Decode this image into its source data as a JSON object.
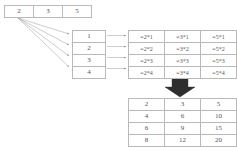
{
  "diagram": {
    "source_row": {
      "name": "source-values",
      "values": [
        "2",
        "3",
        "5"
      ]
    },
    "multiplier_column": {
      "name": "multiplier-values",
      "values": [
        "1",
        "2",
        "3",
        "4"
      ]
    },
    "formula_grid": {
      "name": "formula-table",
      "rows": [
        [
          "=2*1",
          "=3*1",
          "=5*1"
        ],
        [
          "=2*2",
          "=3*2",
          "=5*2"
        ],
        [
          "=2*3",
          "=3*3",
          "=5*3"
        ],
        [
          "=2*4",
          "=3*4",
          "=5*4"
        ]
      ]
    },
    "result_grid": {
      "name": "result-table",
      "rows": [
        [
          "2",
          "3",
          "5"
        ],
        [
          "4",
          "6",
          "10"
        ],
        [
          "6",
          "9",
          "15"
        ],
        [
          "8",
          "12",
          "20"
        ]
      ]
    },
    "connectors": {
      "fan_arrow_count": 4,
      "row_arrow_count": 4,
      "big_arrow_direction": "down"
    },
    "colors": {
      "border": "#b9b9b9",
      "text": "#555555",
      "thin_arrow": "#9a9a9a",
      "big_arrow": "#2e2e2e",
      "background": "#ffffff"
    }
  }
}
